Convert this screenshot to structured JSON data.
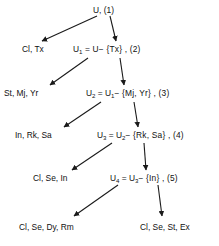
{
  "diagram": {
    "type": "tree",
    "background_color": "#ffffff",
    "line_color": "#1a1a1a",
    "levels": [
      {
        "index": 1,
        "root_label": "U, (1)",
        "root_prefix": "U",
        "root_sub": "",
        "root_suffix": ", (1)",
        "leaf_label": "Cl, Tx"
      },
      {
        "index": 2,
        "root_prefix": "U",
        "root_sub": "1",
        "root_suffix": " = U− {Tx} , (2)",
        "leaf_label": "St, Mj, Yr"
      },
      {
        "index": 3,
        "root_prefix": "U",
        "root_sub": "2",
        "root_suffix": " = U",
        "root_sub2": "1",
        "root_suffix2": "− {Mj, Yr} , (3)",
        "leaf_label": "In, Rk, Sa"
      },
      {
        "index": 4,
        "root_prefix": "U",
        "root_sub": "3",
        "root_suffix": " = U",
        "root_sub2": "2",
        "root_suffix2": "− {Rk, Sa} , (4)",
        "leaf_label": "Cl, Se, In"
      },
      {
        "index": 5,
        "root_prefix": "U",
        "root_sub": "4",
        "root_suffix": " = U",
        "root_sub2": "3",
        "root_suffix2": "− {In} , (5)",
        "leaf_label": "Cl, Se, Dy, Rm"
      }
    ],
    "terminal_label": "Cl, Se, St, Ex"
  }
}
